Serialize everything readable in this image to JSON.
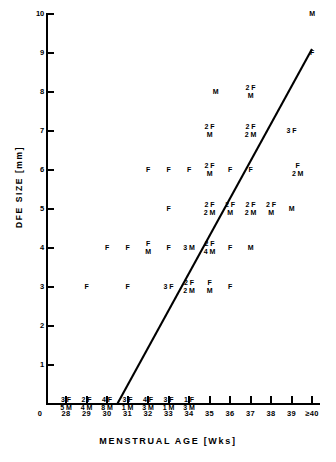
{
  "chart_data": {
    "type": "scatter",
    "title": "",
    "xlabel": "MENSTRUAL AGE (Wks)",
    "ylabel": "DFE SIZE (mm)",
    "xlabel_display": "MENSTRUAL AGE [Wks]",
    "ylabel_display": "DFE SIZE [mm]",
    "grid": false,
    "legend": "none",
    "xlim": [
      27.5,
      40.5
    ],
    "ylim": [
      0,
      10
    ],
    "x_ticks": [
      "0",
      "28",
      "29",
      "30",
      "31",
      "32",
      "33",
      "34",
      "35",
      "36",
      "37",
      "38",
      "39",
      "≥40"
    ],
    "y_ticks": [
      "1",
      "2",
      "3",
      "4",
      "5",
      "6",
      "7",
      "8",
      "9",
      "10"
    ],
    "annotation_note": "Each plotted label gives counts of Female (F) and Male (M) fetuses at that menstrual age and DFE size.",
    "points": [
      {
        "x": 28,
        "y": 0,
        "label": "3 F\n5 M"
      },
      {
        "x": 29,
        "y": 0,
        "label": "2 F\n4 M"
      },
      {
        "x": 30,
        "y": 0,
        "label": "4 F\n8 M"
      },
      {
        "x": 31,
        "y": 0,
        "label": "3 F\n1 M"
      },
      {
        "x": 32,
        "y": 0,
        "label": "4 F\n3 M"
      },
      {
        "x": 33,
        "y": 0,
        "label": "3 F\n1 M"
      },
      {
        "x": 34,
        "y": 0,
        "label": "1 F\n3 M"
      },
      {
        "x": 29,
        "y": 3,
        "label": "F"
      },
      {
        "x": 31,
        "y": 3,
        "label": "F"
      },
      {
        "x": 33,
        "y": 3,
        "label": "3 F"
      },
      {
        "x": 34,
        "y": 3,
        "label": "2 F\n2 M"
      },
      {
        "x": 35,
        "y": 3,
        "label": "F\nM"
      },
      {
        "x": 36,
        "y": 3,
        "label": "F"
      },
      {
        "x": 30,
        "y": 4,
        "label": "F"
      },
      {
        "x": 31,
        "y": 4,
        "label": "F"
      },
      {
        "x": 32,
        "y": 4,
        "label": "F\nM"
      },
      {
        "x": 33,
        "y": 4,
        "label": "F"
      },
      {
        "x": 34,
        "y": 4,
        "label": "3 M"
      },
      {
        "x": 35,
        "y": 4,
        "label": "2 F\n4 M"
      },
      {
        "x": 36,
        "y": 4,
        "label": "F"
      },
      {
        "x": 37,
        "y": 4,
        "label": "M"
      },
      {
        "x": 33,
        "y": 5,
        "label": "F"
      },
      {
        "x": 35,
        "y": 5,
        "label": "2 F\n2 M"
      },
      {
        "x": 36,
        "y": 5,
        "label": "2 F\nM"
      },
      {
        "x": 37,
        "y": 5,
        "label": "2 F\n2 M"
      },
      {
        "x": 38,
        "y": 5,
        "label": "2 F\nM"
      },
      {
        "x": 39,
        "y": 5,
        "label": "M"
      },
      {
        "x": 32,
        "y": 6,
        "label": "F"
      },
      {
        "x": 33,
        "y": 6,
        "label": "F"
      },
      {
        "x": 34,
        "y": 6,
        "label": "F"
      },
      {
        "x": 35,
        "y": 6,
        "label": "2 F\nM"
      },
      {
        "x": 36,
        "y": 6,
        "label": "F"
      },
      {
        "x": 37,
        "y": 6,
        "label": "F"
      },
      {
        "x": 39.3,
        "y": 6,
        "label": "F\n2 M"
      },
      {
        "x": 35,
        "y": 7,
        "label": "2 F\nM"
      },
      {
        "x": 37,
        "y": 7,
        "label": "2 F\n2 M"
      },
      {
        "x": 39,
        "y": 7,
        "label": "3 F"
      },
      {
        "x": 35.3,
        "y": 8,
        "label": "M"
      },
      {
        "x": 37,
        "y": 8,
        "label": "2 F\nM"
      },
      {
        "x": 40,
        "y": 9,
        "label": "F"
      },
      {
        "x": 40,
        "y": 10,
        "label": "M"
      }
    ],
    "regression_line": {
      "x_start": 30.5,
      "y_start": 0,
      "x_end": 40,
      "y_end": 9.1,
      "color": "#000000"
    }
  },
  "colors": {
    "background": "#ffffff",
    "foreground": "#000000"
  }
}
